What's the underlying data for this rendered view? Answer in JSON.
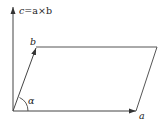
{
  "diagram": {
    "type": "vector-cross-product-parallelogram",
    "labels": {
      "c": "c",
      "equation": "=a×b",
      "b": "b",
      "a": "a",
      "alpha": "α"
    },
    "colors": {
      "line": "#444444",
      "label": "#222222",
      "background": "#ffffff"
    },
    "points": {
      "origin": [
        13,
        111
      ],
      "c_tip": [
        13,
        6
      ],
      "b_tip": [
        36,
        47
      ],
      "a_tip": [
        136,
        111
      ],
      "far_corner": [
        157,
        47
      ]
    }
  }
}
